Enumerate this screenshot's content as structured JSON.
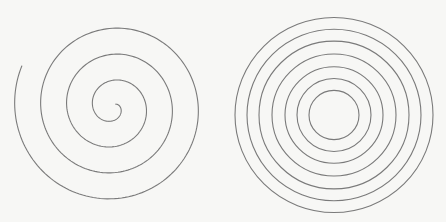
{
  "figures": [
    {
      "id": "archimedean-spiral",
      "kind": "spiral",
      "center": [
        113,
        107
      ],
      "turns": 3.6,
      "inner_radius": 4,
      "spacing": 26,
      "start_angle_deg": 45,
      "end_radius": 100,
      "stroke": "#7a7a7a",
      "stroke_width": 1.1
    },
    {
      "id": "concentric-circles",
      "kind": "rings",
      "center": [
        111,
        115
      ],
      "radii": [
        25,
        37,
        49,
        62,
        75,
        87,
        99
      ],
      "ry_scale": 0.985,
      "stroke": "#7a7a7a",
      "stroke_width": 1.1
    }
  ],
  "background": "#f7f7f5"
}
